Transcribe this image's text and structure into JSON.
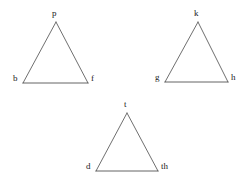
{
  "figure": {
    "type": "diagram",
    "background_color": "#ffffff",
    "line_color": "#4a4a4a",
    "base_line_color": "#3c3c3c",
    "label_color": "#1a1a1a",
    "stroke_width": 0.8
  },
  "triangles": [
    {
      "id": "triangle-1",
      "name": "upper-left-triangle",
      "apex": {
        "label": "p",
        "x": 56,
        "y": 22,
        "label_x": 52,
        "label_y": 9
      },
      "left": {
        "label": "b",
        "x": 23,
        "y": 83,
        "label_x": 13,
        "label_y": 74
      },
      "right": {
        "label": "f",
        "x": 88,
        "y": 83,
        "label_x": 91,
        "label_y": 74
      }
    },
    {
      "id": "triangle-2",
      "name": "upper-right-triangle",
      "apex": {
        "label": "k",
        "x": 198,
        "y": 22,
        "label_x": 194,
        "label_y": 9
      },
      "left": {
        "label": "g",
        "x": 165,
        "y": 82,
        "label_x": 155,
        "label_y": 73
      },
      "right": {
        "label": "h",
        "x": 228,
        "y": 82,
        "label_x": 231,
        "label_y": 73
      }
    },
    {
      "id": "triangle-3",
      "name": "lower-center-triangle",
      "apex": {
        "label": "t",
        "x": 127,
        "y": 113,
        "label_x": 124,
        "label_y": 100
      },
      "left": {
        "label": "d",
        "x": 96,
        "y": 171,
        "label_x": 86,
        "label_y": 162
      },
      "right": {
        "label": "th",
        "x": 158,
        "y": 171,
        "label_x": 161,
        "label_y": 162
      }
    }
  ]
}
